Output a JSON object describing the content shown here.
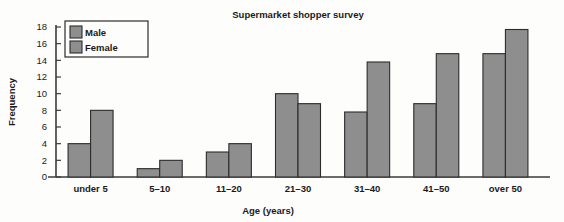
{
  "chart_data": {
    "type": "bar",
    "title": "Supermarket shopper survey",
    "xlabel": "Age (years)",
    "ylabel": "Frequency",
    "categories": [
      "under 5",
      "5–10",
      "11–20",
      "21–30",
      "31–40",
      "41–50",
      "over 50"
    ],
    "series": [
      {
        "name": "Male",
        "color": "#8e8e8e",
        "values": [
          4,
          1,
          3,
          10,
          7.8,
          8.8,
          14.8
        ]
      },
      {
        "name": "Female",
        "color": "#8e8e8e",
        "values": [
          8,
          2,
          4,
          8.8,
          13.8,
          14.8,
          17.7
        ]
      }
    ],
    "ylim": [
      0,
      18
    ],
    "yticks": [
      0,
      2,
      4,
      6,
      8,
      10,
      12,
      14,
      16,
      18
    ],
    "ytick_labels": [
      "0",
      "2",
      "4",
      "6",
      "8",
      "10",
      "12",
      "14",
      "16",
      "18"
    ],
    "grid": false,
    "legend_position": "top-left",
    "bar_outline_color": "#2c2c2c",
    "background_color": "#fdfdfc"
  },
  "axes": {
    "y_title": "Frequency",
    "x_title": "Age (years)"
  },
  "title": {
    "text": "Supermarket shopper survey"
  },
  "legend": {
    "entries": [
      {
        "label": "Male"
      },
      {
        "label": "Female"
      }
    ]
  }
}
